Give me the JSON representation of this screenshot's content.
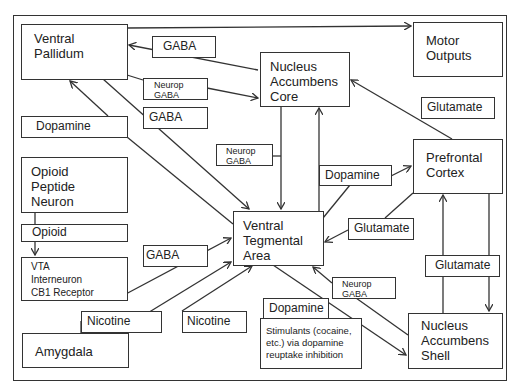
{
  "diagram": {
    "title": "",
    "nodes": {
      "ventral_pallidum": "Ventral\nPallidum",
      "motor_outputs": "Motor\nOutputs",
      "nucleus_accumbens_core": "Nucleus\nAccumbens\nCore",
      "prefrontal_cortex": "Prefrontal\nCortex",
      "opioid_peptide_neuron": "Opioid\nPeptide\nNeuron",
      "vta_interneuron": "VTA\nInterneuron\nCB1 Receptor",
      "ventral_tegmental_area": "Ventral\nTegmental\nArea",
      "amygdala": "Amygdala",
      "stimulants": "Stimulants (cocaine,\netc.) via dopamine\nreuptake inhibition",
      "nucleus_accumbens_shell": "Nucleus\nAccumbens\nShell"
    },
    "edge_labels": {
      "gaba_nac_to_vp": "GABA",
      "neurop_gaba_vp_to_nac": "Neurop\nGABA",
      "gaba_vp_to_vta": "GABA",
      "dopamine_vta_to_vp": "Dopamine",
      "neurop_gaba_nac_to_vta": "Neurop\nGABA",
      "opioid": "Opioid",
      "gaba_interneuron_to_vta": "GABA",
      "nicotine_amygdala": "Nicotine",
      "nicotine_vta": "Nicotine",
      "glutamate_pfc_to_nac": "Glutamate",
      "dopamine_vta_to_pfc": "Dopamine",
      "glutamate_pfc_to_vta": "Glutamate",
      "glutamate_shell_pfc": "Glutamate",
      "neurop_gaba_shell_to_vta": "Neurop\nGABA",
      "dopamine_vta_to_shell": "Dopamine"
    },
    "edges": [
      {
        "from": "Ventral Pallidum",
        "to": "Motor Outputs"
      },
      {
        "from": "Nucleus Accumbens Core",
        "to": "Ventral Pallidum",
        "label": "GABA"
      },
      {
        "from": "Ventral Pallidum",
        "to": "Nucleus Accumbens Core",
        "label": "Neurop GABA"
      },
      {
        "from": "Ventral Pallidum",
        "to": "Ventral Tegmental Area",
        "label": "GABA"
      },
      {
        "from": "Ventral Tegmental Area",
        "to": "Ventral Pallidum",
        "label": "Dopamine"
      },
      {
        "from": "Nucleus Accumbens Core",
        "to": "Ventral Tegmental Area",
        "label": "Neurop GABA"
      },
      {
        "from": "Ventral Tegmental Area",
        "to": "Nucleus Accumbens Core",
        "label": "Dopamine"
      },
      {
        "from": "Opioid Peptide Neuron",
        "to": "VTA Interneuron CB1 Receptor",
        "label": "Opioid"
      },
      {
        "from": "VTA Interneuron CB1 Receptor",
        "to": "Ventral Tegmental Area",
        "label": "GABA"
      },
      {
        "from": "Amygdala",
        "to": "Ventral Tegmental Area",
        "label": "Nicotine"
      },
      {
        "from": "Nicotine",
        "to": "Ventral Tegmental Area",
        "label": "Nicotine"
      },
      {
        "from": "Prefrontal Cortex",
        "to": "Nucleus Accumbens Core",
        "label": "Glutamate"
      },
      {
        "from": "Ventral Tegmental Area",
        "to": "Prefrontal Cortex",
        "label": "Dopamine"
      },
      {
        "from": "Prefrontal Cortex",
        "to": "Ventral Tegmental Area",
        "label": "Glutamate"
      },
      {
        "from": "Nucleus Accumbens Shell",
        "to": "Prefrontal Cortex",
        "label": "Glutamate"
      },
      {
        "from": "Prefrontal Cortex",
        "to": "Nucleus Accumbens Shell",
        "label": "Glutamate"
      },
      {
        "from": "Nucleus Accumbens Shell",
        "to": "Ventral Tegmental Area",
        "label": "Neurop GABA"
      },
      {
        "from": "Ventral Tegmental Area",
        "to": "Nucleus Accumbens Shell",
        "label": "Dopamine"
      }
    ],
    "colors": {
      "line": "#333333",
      "background": "#ffffff"
    }
  }
}
